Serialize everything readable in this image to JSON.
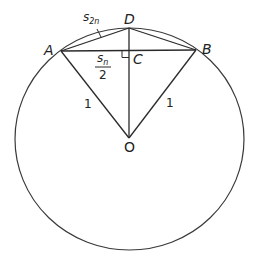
{
  "figure": {
    "colors": {
      "stroke": "#2a2a2a",
      "background": "#ffffff"
    },
    "points": {
      "A": {
        "label": "A",
        "x": 61,
        "y": 51
      },
      "B": {
        "label": "B",
        "x": 196,
        "y": 50
      },
      "C": {
        "label": "C",
        "x": 129,
        "y": 51
      },
      "D": {
        "label": "D",
        "x": 129,
        "y": 28
      },
      "O": {
        "label": "O",
        "x": 129,
        "y": 138
      }
    },
    "labels": {
      "s2n_base": "s",
      "s2n_sub": "2n",
      "sn_num_base": "s",
      "sn_num_sub": "n",
      "sn_den": "2",
      "radius_left": "1",
      "radius_right": "1"
    },
    "circle": {
      "cx": 129.5,
      "cy": 139,
      "rx": 114.5,
      "ry": 111
    }
  }
}
